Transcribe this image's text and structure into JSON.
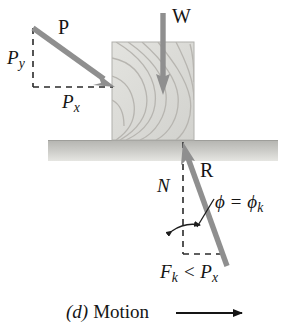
{
  "figure": {
    "caption_label": "(d)",
    "caption_text": "Motion",
    "caption_arrow": "motion-arrow-right"
  },
  "labels": {
    "applied_force": "P",
    "weight": "W",
    "p_vertical_component": "P",
    "p_vertical_component_sub": "y",
    "p_horizontal_component": "P",
    "p_horizontal_component_sub": "x",
    "resultant": "R",
    "normal": "N",
    "friction_angle": "ϕ = ϕ",
    "friction_angle_sub": "k",
    "friction_relation": "F",
    "friction_relation_sub": "k",
    "friction_relation_rest": " < P",
    "friction_relation_rest_sub": "x"
  },
  "vectors": {
    "P": {
      "name": "applied-force-vector",
      "from": [
        33,
        28
      ],
      "to": [
        113,
        86
      ],
      "color": "#8f8f8f"
    },
    "W": {
      "name": "weight-vector",
      "from": [
        163,
        13
      ],
      "to": [
        163,
        93
      ],
      "color": "#8f8f8f"
    },
    "R": {
      "name": "resultant-vector",
      "from": [
        227,
        265
      ],
      "to": [
        184,
        143
      ],
      "color": "#8f8f8f"
    }
  },
  "construction_lines": {
    "py_vertical": {
      "from": [
        33,
        28
      ],
      "to": [
        33,
        87
      ],
      "style": "dashed"
    },
    "px_horizontal": {
      "from": [
        33,
        87
      ],
      "to": [
        113,
        87
      ],
      "style": "dashed"
    },
    "n_vertical": {
      "from": [
        183,
        142
      ],
      "to": [
        183,
        254
      ],
      "style": "dashed"
    },
    "fk_horizontal": {
      "from": [
        183,
        254
      ],
      "to": [
        226,
        254
      ],
      "style": "dashed"
    },
    "phi_leader": {
      "from": [
        213,
        198
      ],
      "to": [
        196,
        228
      ],
      "style": "solid"
    }
  },
  "angle_arc": {
    "name": "friction-angle-arc",
    "center": [
      183,
      254
    ],
    "radius": 36,
    "start_deg": 90,
    "end_deg": 70
  },
  "block": {
    "name": "wood-block",
    "x": 112,
    "y": 42,
    "width": 82,
    "height": 98,
    "fill": "#dcdcd8",
    "stroke": "#b4b4b0",
    "grain_color": "#b9b7b2"
  },
  "ground": {
    "name": "ground-surface",
    "x": 48,
    "y": 140,
    "width": 230,
    "height": 21,
    "fill_top": "#b9b9b5",
    "fill_bottom": "#e2e2de"
  },
  "colors": {
    "arrow_gray": "#8f8f8f",
    "ink": "#151515",
    "dash_gray": "#2a2a2a",
    "block_fill": "#dcdcd8",
    "ground_gray": "#bdbdb9",
    "page_background": "#ffffff"
  }
}
